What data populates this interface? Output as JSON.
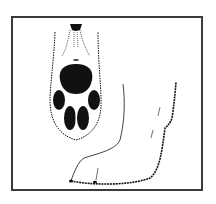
{
  "illustration": {
    "subject": "animal paw illustration",
    "views": [
      {
        "name": "paw-bottom-view",
        "description": "underside of paw with pads"
      },
      {
        "name": "foot-side-view",
        "description": "side profile of lower leg and foot"
      }
    ],
    "colors": {
      "ink": "#111111",
      "frame": "#3a3a3a",
      "background": "#ffffff"
    }
  }
}
